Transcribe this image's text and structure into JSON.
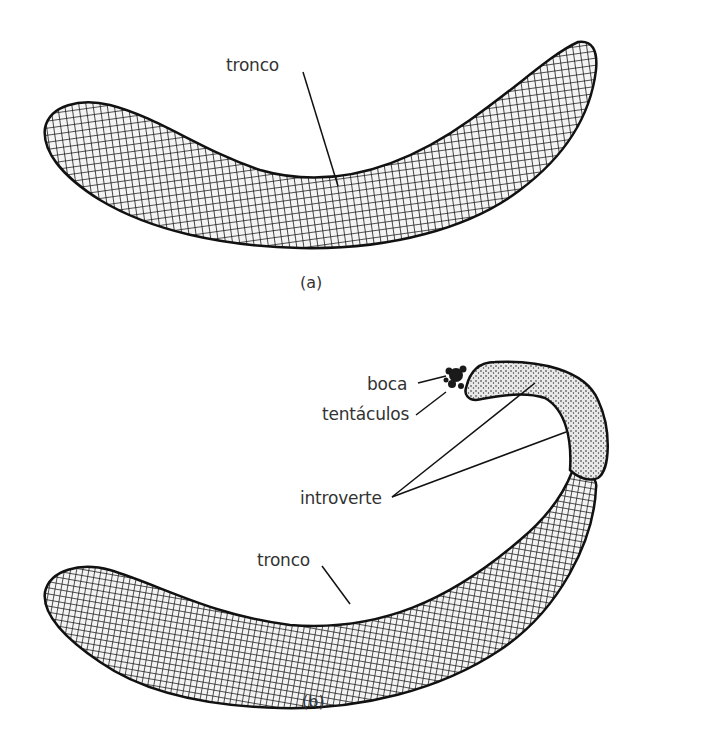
{
  "figure_a": {
    "caption": "(a)",
    "labels": {
      "trunk": "tronco"
    }
  },
  "figure_b": {
    "caption": "(b)",
    "labels": {
      "mouth": "boca",
      "tentacles": "tentáculos",
      "introvert": "introverte",
      "trunk": "tronco"
    }
  },
  "colors": {
    "ink": "#1a1a1a",
    "background": "#ffffff",
    "label_text": "#333333"
  }
}
